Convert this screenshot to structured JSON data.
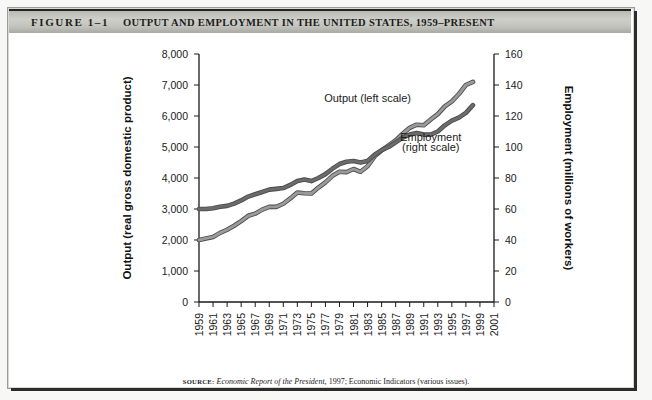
{
  "figure": {
    "number": "FIGURE 1–1",
    "title": "OUTPUT AND EMPLOYMENT IN THE UNITED STATES, 1959–PRESENT",
    "source_label": "SOURCE:",
    "source_italic": "Economic Report of the President,",
    "source_rest": " 1997; Economic Indicators (various issues)."
  },
  "chart_data": {
    "type": "line",
    "title": "Output and Employment in the United States, 1959–Present",
    "xlabel": "",
    "ylabel": "Output (real gross domestic product)",
    "y2label": "Employment (millions of workers)",
    "xlim": [
      1959,
      2001
    ],
    "ylim": [
      0,
      8000
    ],
    "y2lim": [
      0,
      160
    ],
    "grid": false,
    "legend_position": "inline-annotations",
    "yticks": [
      "0",
      "1,000",
      "2,000",
      "3,000",
      "4,000",
      "5,000",
      "6,000",
      "7,000",
      "8,000"
    ],
    "ytick_values": [
      0,
      1000,
      2000,
      3000,
      4000,
      5000,
      6000,
      7000,
      8000
    ],
    "y2ticks": [
      "0",
      "20",
      "40",
      "60",
      "80",
      "100",
      "120",
      "140",
      "160"
    ],
    "y2tick_values": [
      0,
      20,
      40,
      60,
      80,
      100,
      120,
      140,
      160
    ],
    "xticks": [
      "1959",
      "1961",
      "1963",
      "1965",
      "1967",
      "1969",
      "1971",
      "1973",
      "1975",
      "1977",
      "1979",
      "1981",
      "1983",
      "1985",
      "1987",
      "1989",
      "1991",
      "1993",
      "1995",
      "1997",
      "1999",
      "2001"
    ],
    "xtick_values": [
      1959,
      1961,
      1963,
      1965,
      1967,
      1969,
      1971,
      1973,
      1975,
      1977,
      1979,
      1981,
      1983,
      1985,
      1987,
      1989,
      1991,
      1993,
      1995,
      1997,
      1999,
      2001
    ],
    "annotations": [
      {
        "text": "Output (left scale)",
        "x": 1983,
        "y": 6450
      },
      {
        "text": "Employment",
        "x": 1992,
        "y": 5180
      },
      {
        "text": "(right scale)",
        "x": 1992,
        "y": 4880
      }
    ],
    "colors": {
      "output": "#9a9a9a",
      "employment": "#6b6b6b"
    },
    "x": [
      1959,
      1960,
      1961,
      1962,
      1963,
      1964,
      1965,
      1966,
      1967,
      1968,
      1969,
      1970,
      1971,
      1972,
      1973,
      1974,
      1975,
      1976,
      1977,
      1978,
      1979,
      1980,
      1981,
      1982,
      1983,
      1984,
      1985,
      1986,
      1987,
      1988,
      1989,
      1990,
      1991,
      1992,
      1993,
      1994,
      1995,
      1996,
      1997,
      1998
    ],
    "series": [
      {
        "name": "Output (left scale)",
        "axis": "left",
        "units": "billions of real GDP",
        "values": [
          2000,
          2050,
          2100,
          2230,
          2330,
          2460,
          2610,
          2780,
          2850,
          2980,
          3070,
          3070,
          3170,
          3340,
          3530,
          3510,
          3500,
          3690,
          3860,
          4070,
          4200,
          4190,
          4290,
          4200,
          4380,
          4700,
          4890,
          5050,
          5210,
          5430,
          5620,
          5720,
          5700,
          5890,
          6060,
          6310,
          6470,
          6710,
          7000,
          7100
        ]
      },
      {
        "name": "Employment (right scale)",
        "axis": "right",
        "units": "millions of workers",
        "values": [
          60,
          60,
          60.5,
          61.5,
          62,
          63.5,
          65.5,
          68,
          69.5,
          71,
          72.5,
          73,
          73.5,
          75.5,
          78,
          79,
          78,
          80,
          82.5,
          86,
          89,
          90.5,
          91,
          90,
          91,
          95,
          98,
          100,
          103,
          106,
          108,
          109,
          108,
          108,
          110,
          114,
          117,
          119,
          122,
          127
        ]
      }
    ]
  }
}
